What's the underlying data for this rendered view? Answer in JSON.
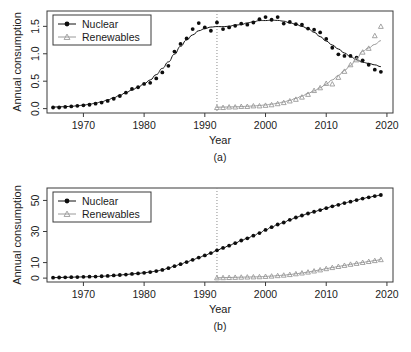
{
  "figure": {
    "title": "",
    "panels": [
      "(a)",
      "(b)"
    ]
  },
  "chart_data": [
    {
      "type": "scatter",
      "id": "panel-a",
      "title": "",
      "subtitle": "",
      "panel_label": "(a)",
      "xlabel": "Year",
      "ylabel": "Annual consumption",
      "xlim": [
        1964,
        2021
      ],
      "ylim": [
        -0.08,
        1.78
      ],
      "xticks": [
        1970,
        1980,
        1990,
        2000,
        2010,
        2020
      ],
      "yticks": [
        0.0,
        0.5,
        1.0,
        1.5
      ],
      "ytick_labels": [
        "0.0",
        "0.5",
        "1.0",
        "1.5"
      ],
      "grid": false,
      "legend_position": "top-left",
      "annotations": [
        {
          "type": "vertical-dotted-line",
          "x": 1992,
          "label": "renewables series start"
        }
      ],
      "series": [
        {
          "name": "Nuclear",
          "marker": "filled-circle",
          "color": "#0d0d0d",
          "x": [
            1965,
            1966,
            1967,
            1968,
            1969,
            1970,
            1971,
            1972,
            1973,
            1974,
            1975,
            1976,
            1977,
            1978,
            1979,
            1980,
            1981,
            1982,
            1983,
            1984,
            1985,
            1986,
            1987,
            1988,
            1989,
            1990,
            1991,
            1992,
            1993,
            1994,
            1995,
            1996,
            1997,
            1998,
            1999,
            2000,
            2001,
            2002,
            2003,
            2004,
            2005,
            2006,
            2007,
            2008,
            2009,
            2010,
            2011,
            2012,
            2013,
            2014,
            2015,
            2016,
            2017,
            2018,
            2019
          ],
          "values": [
            0.02,
            0.02,
            0.03,
            0.04,
            0.05,
            0.06,
            0.07,
            0.09,
            0.11,
            0.14,
            0.18,
            0.23,
            0.29,
            0.36,
            0.39,
            0.45,
            0.47,
            0.55,
            0.66,
            0.78,
            1.04,
            1.18,
            1.28,
            1.45,
            1.56,
            1.48,
            1.42,
            1.57,
            1.45,
            1.48,
            1.51,
            1.55,
            1.53,
            1.57,
            1.63,
            1.67,
            1.62,
            1.67,
            1.55,
            1.58,
            1.54,
            1.53,
            1.46,
            1.44,
            1.39,
            1.27,
            1.11,
            0.99,
            0.96,
            0.96,
            0.93,
            0.88,
            0.8,
            0.71,
            0.67
          ],
          "smooth_curve": true
        },
        {
          "name": "Renewables",
          "marker": "open-triangle",
          "color": "#9a9a9a",
          "x": [
            1992,
            1993,
            1994,
            1995,
            1996,
            1997,
            1998,
            1999,
            2000,
            2001,
            2002,
            2003,
            2004,
            2005,
            2006,
            2007,
            2008,
            2009,
            2010,
            2011,
            2012,
            2013,
            2014,
            2015,
            2016,
            2017,
            2018,
            2019
          ],
          "values": [
            0.02,
            0.02,
            0.03,
            0.03,
            0.04,
            0.04,
            0.05,
            0.05,
            0.06,
            0.07,
            0.09,
            0.11,
            0.14,
            0.17,
            0.21,
            0.26,
            0.33,
            0.38,
            0.46,
            0.45,
            0.57,
            0.68,
            0.8,
            0.89,
            1.03,
            1.1,
            1.33,
            1.5
          ],
          "smooth_curve": true
        }
      ]
    },
    {
      "type": "scatter",
      "id": "panel-b",
      "title": "",
      "subtitle": "",
      "panel_label": "(b)",
      "xlabel": "Year",
      "ylabel": "Annual consumption",
      "xlim": [
        1964,
        2021
      ],
      "ylim": [
        -2.5,
        58
      ],
      "xticks": [
        1970,
        1980,
        1990,
        2000,
        2010,
        2020
      ],
      "yticks": [
        0,
        10,
        30,
        50
      ],
      "ytick_labels": [
        "0",
        "10",
        "30",
        "50"
      ],
      "grid": false,
      "legend_position": "top-left",
      "annotations": [
        {
          "type": "vertical-dotted-line",
          "x": 1992,
          "label": "renewables series start"
        }
      ],
      "series": [
        {
          "name": "Nuclear",
          "marker": "filled-circle",
          "color": "#0d0d0d",
          "x": [
            1965,
            1966,
            1967,
            1968,
            1969,
            1970,
            1971,
            1972,
            1973,
            1974,
            1975,
            1976,
            1977,
            1978,
            1979,
            1980,
            1981,
            1982,
            1983,
            1984,
            1985,
            1986,
            1987,
            1988,
            1989,
            1990,
            1991,
            1992,
            1993,
            1994,
            1995,
            1996,
            1997,
            1998,
            1999,
            2000,
            2001,
            2002,
            2003,
            2004,
            2005,
            2006,
            2007,
            2008,
            2009,
            2010,
            2011,
            2012,
            2013,
            2014,
            2015,
            2016,
            2017,
            2018,
            2019
          ],
          "values": [
            0.3,
            0.4,
            0.5,
            0.6,
            0.7,
            0.8,
            0.9,
            1.0,
            1.2,
            1.4,
            1.7,
            2.0,
            2.3,
            2.7,
            3.0,
            3.4,
            3.9,
            4.5,
            5.3,
            6.4,
            7.7,
            9.0,
            10.3,
            11.8,
            13.2,
            14.6,
            16.1,
            17.9,
            19.4,
            20.9,
            22.5,
            24.2,
            25.6,
            27.3,
            29.0,
            31.0,
            32.8,
            34.5,
            35.8,
            37.5,
            39.0,
            40.3,
            41.6,
            42.7,
            43.8,
            45.0,
            46.2,
            47.2,
            48.3,
            49.2,
            50.2,
            51.2,
            52.0,
            52.8,
            53.5
          ],
          "smooth_curve": false
        },
        {
          "name": "Renewables",
          "marker": "open-triangle",
          "color": "#9a9a9a",
          "x": [
            1992,
            1993,
            1994,
            1995,
            1996,
            1997,
            1998,
            1999,
            2000,
            2001,
            2002,
            2003,
            2004,
            2005,
            2006,
            2007,
            2008,
            2009,
            2010,
            2011,
            2012,
            2013,
            2014,
            2015,
            2016,
            2017,
            2018,
            2019
          ],
          "values": [
            0.2,
            0.3,
            0.4,
            0.5,
            0.6,
            0.7,
            0.8,
            0.9,
            1.1,
            1.3,
            1.6,
            1.9,
            2.3,
            2.8,
            3.3,
            3.9,
            4.6,
            5.3,
            6.1,
            6.8,
            7.5,
            8.2,
            8.9,
            9.5,
            10.1,
            10.7,
            11.3,
            11.9
          ],
          "smooth_curve": false
        }
      ]
    }
  ]
}
